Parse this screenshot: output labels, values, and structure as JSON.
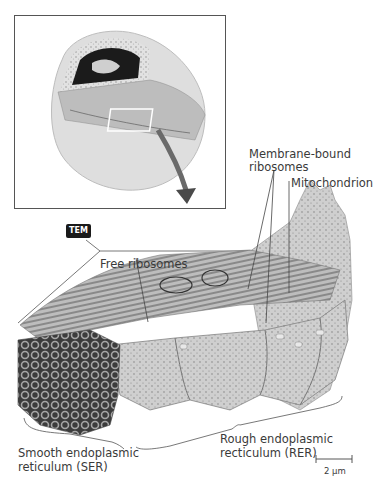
{
  "figure": {
    "inset": {
      "description": "cutaway view of a cell showing nucleus and endoplasmic reticulum; white rectangle marks magnified region; arrow points to enlarged view"
    },
    "badge": "TEM",
    "labels": {
      "membrane_bound": [
        "Membrane-bound",
        "ribosomes"
      ],
      "mitochondrion": "Mitochondrion",
      "free_ribosomes": "Free ribosomes",
      "ser": [
        "Smooth endoplasmic",
        "reticulum (SER)"
      ],
      "rer": [
        "Rough endoplasmic",
        "recticulum (RER)"
      ]
    },
    "scale_bar": {
      "label": "2 µm"
    },
    "colors": {
      "outline": "#555555",
      "illustration_light": "#d9d9d9",
      "illustration_mid": "#a8a8a8",
      "illustration_dark": "#4a4a4a",
      "badge_bg": "#1a1a1a",
      "arrow": "#6a6a6a"
    }
  }
}
